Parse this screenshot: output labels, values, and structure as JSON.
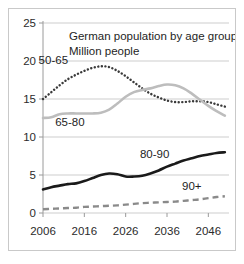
{
  "chart_data": {
    "type": "line",
    "title": "German population by age groups",
    "subtitle": "Million people",
    "xlabel": "",
    "ylabel": "",
    "ylim": [
      0,
      25
    ],
    "xlim": [
      2006,
      2051
    ],
    "yticks": [
      "0",
      "5",
      "10",
      "15",
      "20",
      "25"
    ],
    "ytick_values": [
      0,
      5,
      10,
      15,
      20,
      25
    ],
    "xticks": [
      "2006",
      "2016",
      "2026",
      "2036",
      "2046"
    ],
    "xtick_values": [
      2006,
      2016,
      2026,
      2036,
      2046
    ],
    "grid": "horizontal",
    "legend": "inline-labels",
    "x": [
      2006,
      2008,
      2010,
      2012,
      2014,
      2016,
      2018,
      2020,
      2022,
      2024,
      2026,
      2028,
      2030,
      2032,
      2034,
      2036,
      2038,
      2040,
      2042,
      2044,
      2046,
      2048,
      2050
    ],
    "series": [
      {
        "name": "50-65",
        "style": "dotted",
        "color": "#3a3a3a",
        "label": "50-65",
        "values": [
          15.0,
          15.9,
          16.8,
          17.6,
          18.2,
          18.7,
          19.1,
          19.3,
          19.2,
          18.7,
          18.0,
          17.2,
          16.4,
          15.7,
          15.2,
          14.8,
          14.6,
          14.6,
          14.7,
          14.7,
          14.6,
          14.3,
          14.0
        ]
      },
      {
        "name": "65-80",
        "style": "solid",
        "color": "#bdbdbd",
        "label": "65-80",
        "values": [
          12.5,
          12.6,
          13.0,
          13.1,
          13.1,
          13.1,
          13.1,
          13.2,
          13.6,
          14.4,
          15.3,
          15.9,
          16.2,
          16.4,
          16.7,
          16.9,
          16.8,
          16.4,
          15.7,
          14.9,
          14.1,
          13.4,
          12.8
        ]
      },
      {
        "name": "80-90",
        "style": "solid",
        "color": "#1a1a1a",
        "label": "80-90",
        "values": [
          3.1,
          3.4,
          3.6,
          3.8,
          3.9,
          4.2,
          4.6,
          5.0,
          5.2,
          5.1,
          4.8,
          4.8,
          4.9,
          5.2,
          5.6,
          6.1,
          6.5,
          6.9,
          7.2,
          7.5,
          7.7,
          7.9,
          8.0
        ]
      },
      {
        "name": "90+",
        "style": "dashed",
        "color": "#8a8a8a",
        "label": "90+",
        "values": [
          0.5,
          0.55,
          0.6,
          0.65,
          0.7,
          0.8,
          0.85,
          0.9,
          0.95,
          1.0,
          1.1,
          1.2,
          1.3,
          1.35,
          1.4,
          1.45,
          1.5,
          1.6,
          1.7,
          1.8,
          1.95,
          2.1,
          2.2
        ]
      }
    ],
    "annotations": [
      {
        "name": "label-50-65",
        "text": "50-65",
        "x": 2008.5,
        "y": 19.6
      },
      {
        "name": "label-65-80",
        "text": "65-80",
        "x": 2012.5,
        "y": 11.4
      },
      {
        "name": "label-80-90",
        "text": "80-90",
        "x": 2033.0,
        "y": 7.3
      },
      {
        "name": "label-90+",
        "text": "90+",
        "x": 2042.0,
        "y": 3.0
      }
    ],
    "colors": {
      "axis": "#9a9a9a",
      "grid": "#c0c0c0",
      "border": "#c9c9c9",
      "text": "#1e1e1e",
      "series_50_65": "#3a3a3a",
      "series_65_80": "#bdbdbd",
      "series_80_90": "#1a1a1a",
      "series_90_plus": "#8a8a8a"
    }
  }
}
